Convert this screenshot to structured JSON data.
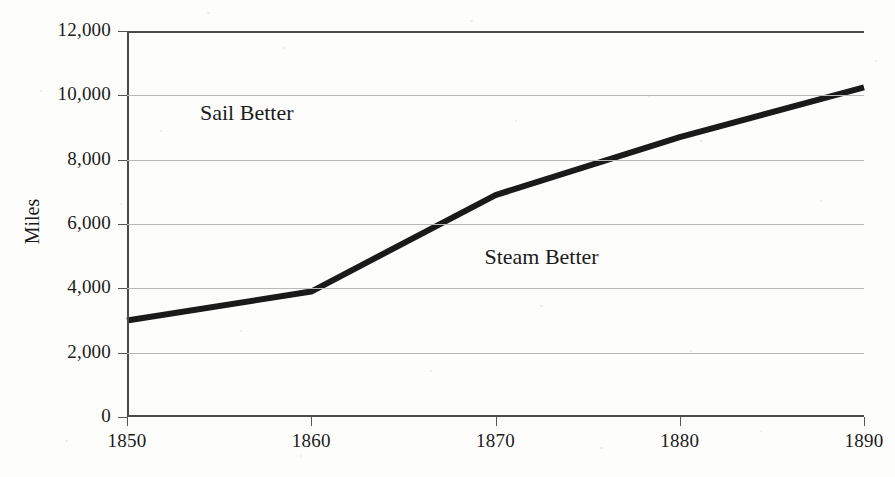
{
  "figure": {
    "width": 895,
    "height": 477,
    "background_color": "#fdfdfc",
    "line_color": "#1a1a1a",
    "grid_color": "#b9b9b9",
    "frame_color": "#4a4a4a",
    "text_color": "#1b1b1b"
  },
  "chart_data": {
    "type": "line",
    "title": "",
    "xlabel": "",
    "ylabel": "Miles",
    "x": [
      1850,
      1860,
      1870,
      1880,
      1890
    ],
    "series": [
      {
        "name": "Miles",
        "values": [
          3000,
          3900,
          6900,
          8700,
          10250
        ]
      }
    ],
    "xlim": [
      1850,
      1890
    ],
    "ylim": [
      0,
      12000
    ],
    "xticks": [
      1850,
      1860,
      1870,
      1880,
      1890
    ],
    "xtick_labels": [
      "1850",
      "1860",
      "1870",
      "1880",
      "1890"
    ],
    "yticks": [
      0,
      2000,
      4000,
      6000,
      8000,
      10000,
      12000
    ],
    "ytick_labels": [
      "0",
      "2,000",
      "4,000",
      "6,000",
      "8,000",
      "10,000",
      "12,000"
    ],
    "grid": "horizontal",
    "legend": "none",
    "annotations": [
      {
        "text": "Sail Better",
        "x": 1856.5,
        "y": 9400
      },
      {
        "text": "Steam Better",
        "x": 1872.5,
        "y": 4900
      }
    ]
  }
}
